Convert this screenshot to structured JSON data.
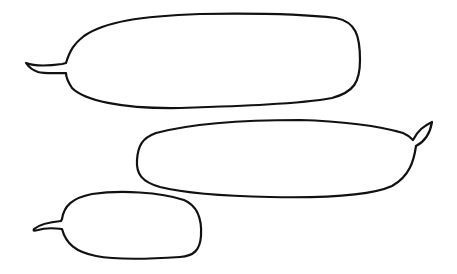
{
  "canvas": {
    "width": 457,
    "height": 274,
    "background": "#ffffff",
    "stroke": "#111111"
  },
  "bubbles": [
    {
      "id": "top",
      "text": "",
      "tail_direction": "left"
    },
    {
      "id": "middle",
      "text": "",
      "tail_direction": "right"
    },
    {
      "id": "bottom",
      "text": "",
      "tail_direction": "left"
    }
  ]
}
